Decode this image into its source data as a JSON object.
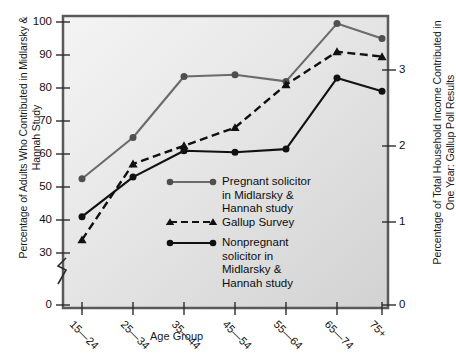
{
  "chart_data": {
    "type": "line",
    "title": "",
    "xlabel": "Age Group",
    "ylabel": "Percentage of Adults Who Contributed in Midlarsky & Hannah Study",
    "ylabel_right": "Percentage of Total Household Income Contributed in One Year: Gallup Poll Results",
    "categories": [
      "15—24",
      "25—34",
      "35—44",
      "45—54",
      "55—64",
      "65—74",
      "75+"
    ],
    "yticks": [
      100,
      90,
      80,
      70,
      60,
      50,
      40,
      30,
      0
    ],
    "ylim": [
      30,
      100
    ],
    "y_axis_break": true,
    "y2ticks": [
      3,
      2,
      1,
      0
    ],
    "y2lim": [
      0,
      3.5
    ],
    "grid": false,
    "legend_position": "inside-lower-center",
    "series": [
      {
        "name": "Pregnant solicitor in Midlarsky & Hannah study",
        "axis": "left",
        "color": "#6b6b6b",
        "marker": "circle",
        "linestyle": "solid",
        "values": [
          52.5,
          65.0,
          83.5,
          84.0,
          82.0,
          99.5,
          95.0
        ]
      },
      {
        "name": "Gallup Survey",
        "axis": "right",
        "color": "#111111",
        "marker": "triangle",
        "linestyle": "dashed",
        "values": [
          34.0,
          57.0,
          62.5,
          68.0,
          81.0,
          91.0,
          89.5
        ]
      },
      {
        "name": "Nonpregnant solicitor in Midlarsky & Hannah study",
        "axis": "left",
        "color": "#111111",
        "marker": "circle",
        "linestyle": "solid",
        "values": [
          41.0,
          53.0,
          61.0,
          60.5,
          61.5,
          83.0,
          79.0
        ]
      }
    ],
    "legend_entries": [
      "Pregnant solicitor\nin Midlarsky &\nHannah study",
      "Gallup Survey",
      "Nonpregnant\nsolicitor in\nMidlarsky &\nHannah study"
    ]
  },
  "axis": {
    "ytick_labels": [
      "100",
      "90",
      "80",
      "70",
      "60",
      "50",
      "40",
      "30",
      "0"
    ],
    "y2tick_labels": [
      "3",
      "2",
      "1",
      "0"
    ],
    "xtick_labels": [
      "15—24",
      "25—34",
      "35—44",
      "45—54",
      "55—64",
      "65—74",
      "75+"
    ],
    "xlabel": "Age Group",
    "ylabel_left": "Percentage of Adults Who Contributed\nin Midlarsky & Hannah Study",
    "ylabel_right": "Percentage of Total Household Income\nContributed in One Year: Gallup Poll Results"
  },
  "legend": {
    "item1": "Pregnant solicitor\nin Midlarsky &\nHannah study",
    "item2": "Gallup Survey",
    "item3": "Nonpregnant\nsolicitor in\nMidlarsky &\nHannah study"
  },
  "colors": {
    "series1": "#6b6b6b",
    "series2": "#111111",
    "series3": "#111111",
    "plot_bg_top": "#f2f2f2",
    "plot_bg_bottom": "#d8d8d8",
    "border": "#4a4a4a"
  }
}
